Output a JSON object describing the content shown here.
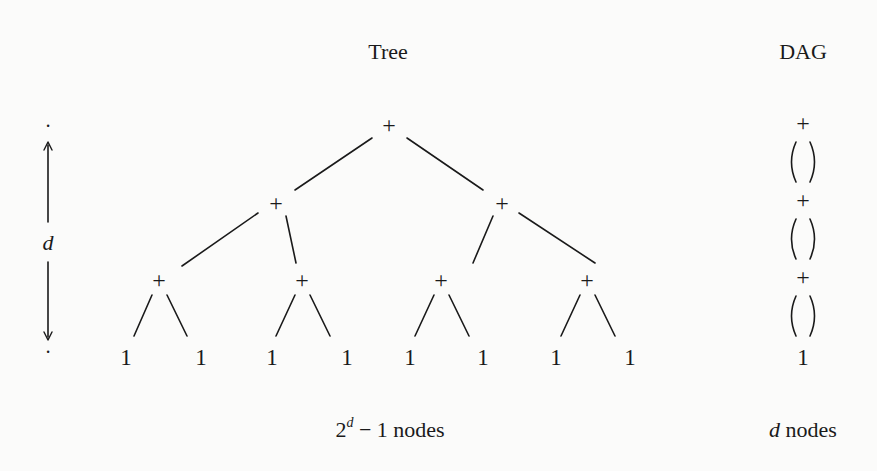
{
  "titles": {
    "tree": "Tree",
    "dag": "DAG"
  },
  "depth_marker": {
    "label": "d",
    "top_dot": "·",
    "bottom_dot": "·"
  },
  "tree": {
    "root": "+",
    "level2": [
      "+",
      "+"
    ],
    "level3": [
      "+",
      "+",
      "+",
      "+"
    ],
    "leaves": [
      "1",
      "1",
      "1",
      "1",
      "1",
      "1",
      "1",
      "1"
    ],
    "caption_base": "2",
    "caption_exp": "d",
    "caption_rest": " − 1 nodes"
  },
  "dag": {
    "nodes": [
      "+",
      "+",
      "+"
    ],
    "leaf": "1",
    "caption_var": "d",
    "caption_rest": " nodes"
  },
  "colors": {
    "ink": "#1a1a1a",
    "background": "#fbfbfa"
  }
}
